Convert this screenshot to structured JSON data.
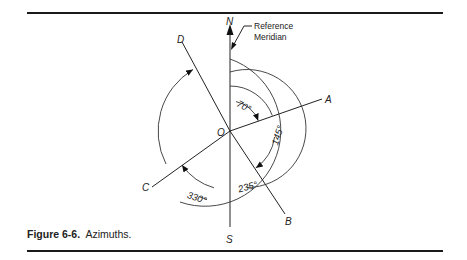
{
  "figure": {
    "caption_number": "Figure 6-6.",
    "caption_text": "Azimuths.",
    "center_label": "O",
    "reference_note": [
      "Reference",
      "Meridian"
    ]
  },
  "diagram": {
    "meridian": {
      "north_label": "N",
      "south_label": "S"
    },
    "lines": [
      {
        "label": "A",
        "azimuth_deg": 70
      },
      {
        "label": "B",
        "azimuth_deg": 145
      },
      {
        "label": "C",
        "azimuth_deg": 235
      },
      {
        "label": "D",
        "azimuth_deg": 330
      }
    ],
    "angle_labels": [
      "70°",
      "145°",
      "235°",
      "330°"
    ]
  }
}
